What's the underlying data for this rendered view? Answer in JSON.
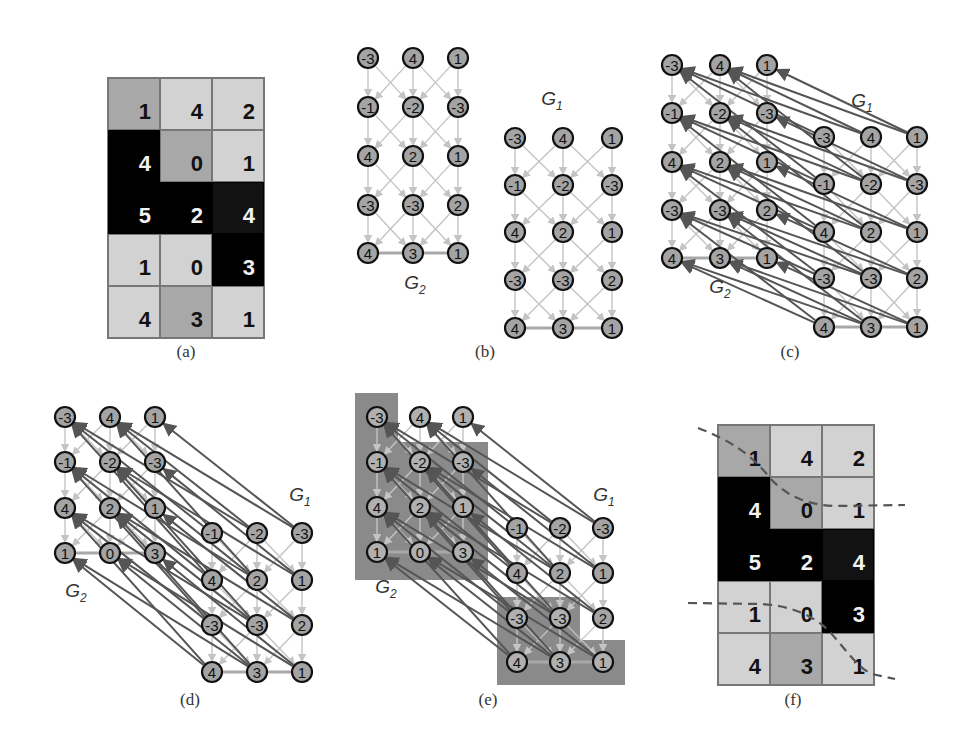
{
  "figure": {
    "captions": {
      "a": "(a)",
      "b": "(b)",
      "c": "(c)",
      "d": "(d)",
      "e": "(e)",
      "f": "(f)"
    },
    "graph_labels": {
      "g1": "G",
      "g1_sub": "1",
      "g2": "G",
      "g2_sub": "2"
    },
    "colors": {
      "light_cell": "#d2d2d2",
      "mid_cell": "#a8a8a8",
      "black_cell": "#000000",
      "node_fill": "#a4a4a4",
      "node_stroke": "#111111",
      "light_edge": "#c4c4c4",
      "dark_edge": "#555555",
      "shade_region": "#8a8a8a",
      "dashed_line": "#555555"
    }
  },
  "grid_a": {
    "values": [
      [
        "1",
        "4",
        "2"
      ],
      [
        "4",
        "0",
        "1"
      ],
      [
        "5",
        "2",
        "4"
      ],
      [
        "1",
        "0",
        "3"
      ],
      [
        "4",
        "3",
        "1"
      ]
    ],
    "shades": [
      [
        "mid",
        "light",
        "light"
      ],
      [
        "black",
        "mid",
        "light"
      ],
      [
        "black",
        "black",
        "dark"
      ],
      [
        "light",
        "light",
        "black"
      ],
      [
        "light",
        "mid",
        "light"
      ]
    ]
  },
  "grid_f": {
    "values": [
      [
        "1",
        "4",
        "2"
      ],
      [
        "4",
        "0",
        "1"
      ],
      [
        "5",
        "2",
        "4"
      ],
      [
        "1",
        "0",
        "3"
      ],
      [
        "4",
        "3",
        "1"
      ]
    ],
    "shades": [
      [
        "mid",
        "light",
        "light"
      ],
      [
        "black",
        "mid",
        "light"
      ],
      [
        "black",
        "black",
        "dark"
      ],
      [
        "light",
        "light",
        "black"
      ],
      [
        "light",
        "mid",
        "light"
      ]
    ]
  },
  "graph_nodes_full": [
    [
      "-3",
      "4",
      "1"
    ],
    [
      "-1",
      "-2",
      "-3"
    ],
    [
      "4",
      "2",
      "1"
    ],
    [
      "-3",
      "-3",
      "2"
    ],
    [
      "4",
      "3",
      "1"
    ]
  ],
  "panel_d_e": {
    "g2_nodes": [
      [
        "-3",
        "4",
        "1"
      ],
      [
        "-1",
        "-2",
        "-3"
      ],
      [
        "4",
        "2",
        "1"
      ],
      [
        "1",
        "0",
        "3"
      ]
    ],
    "g1_nodes": [
      [
        "-1",
        "-2",
        "-3"
      ],
      [
        "4",
        "2",
        "1"
      ],
      [
        "-3",
        "-3",
        "2"
      ],
      [
        "4",
        "3",
        "1"
      ]
    ]
  },
  "chart_data": {
    "type": "diagram",
    "title": "",
    "panels": [
      {
        "id": "a",
        "kind": "grid",
        "rows": 5,
        "cols": 3,
        "values": [
          [
            1,
            4,
            2
          ],
          [
            4,
            0,
            1
          ],
          [
            5,
            2,
            4
          ],
          [
            1,
            0,
            3
          ],
          [
            4,
            3,
            1
          ]
        ]
      },
      {
        "id": "b",
        "kind": "two-graphs",
        "graphs": [
          "G1",
          "G2"
        ],
        "node_grid": [
          [
            -3,
            4,
            1
          ],
          [
            -1,
            -2,
            -3
          ],
          [
            4,
            2,
            1
          ],
          [
            -3,
            -3,
            2
          ],
          [
            4,
            3,
            1
          ]
        ],
        "note": "separate 5x3 graphs with light directed edges"
      },
      {
        "id": "c",
        "kind": "two-graphs-connected",
        "graphs": [
          "G1",
          "G2"
        ],
        "note": "G1 offset down-right, dark arrows connecting G1 to G2"
      },
      {
        "id": "d",
        "kind": "two-graphs-connected",
        "g2_rows": [
          [
            -3,
            4,
            1
          ],
          [
            -1,
            -2,
            -3
          ],
          [
            4,
            2,
            1
          ],
          [
            1,
            0,
            3
          ]
        ],
        "g1_rows": [
          [
            -1,
            -2,
            -3
          ],
          [
            4,
            2,
            1
          ],
          [
            -3,
            -3,
            2
          ],
          [
            4,
            3,
            1
          ]
        ]
      },
      {
        "id": "e",
        "kind": "two-graphs-segmented",
        "note": "shaded regions show cut"
      },
      {
        "id": "f",
        "kind": "grid-with-cut",
        "rows": 5,
        "cols": 3,
        "values": [
          [
            1,
            4,
            2
          ],
          [
            4,
            0,
            1
          ],
          [
            5,
            2,
            4
          ],
          [
            1,
            0,
            3
          ],
          [
            4,
            3,
            1
          ]
        ],
        "note": "two dashed seam lines"
      }
    ]
  }
}
